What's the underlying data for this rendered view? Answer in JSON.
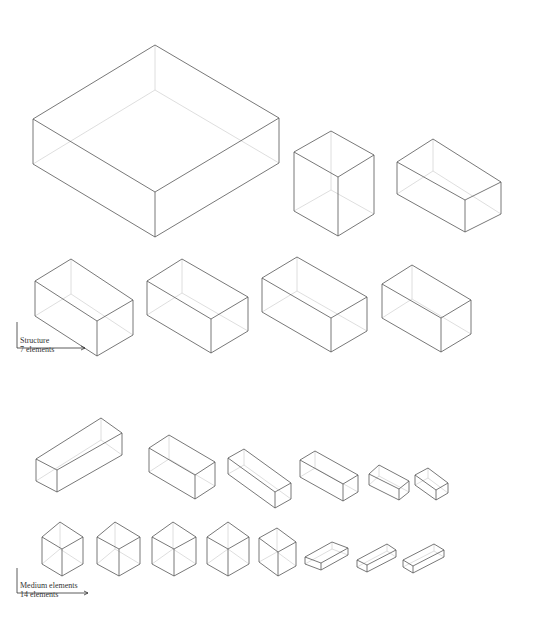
{
  "sections": [
    {
      "id": "structure",
      "title": "Structure",
      "count_label": "7 elements",
      "label_pos": {
        "x": 20,
        "y": 338
      },
      "axis": {
        "x0": 17,
        "y0": 322,
        "y1": 348,
        "x1": 85
      },
      "boxes": [
        {
          "top": [
            155,
            45
          ],
          "left": [
            33,
            119
          ],
          "right": [
            279,
            118
          ],
          "front": [
            155,
            192
          ],
          "h": 45
        },
        {
          "top": [
            331,
            131
          ],
          "left": [
            294,
            152
          ],
          "right": [
            374,
            155
          ],
          "front": [
            338,
            177
          ],
          "h": 59
        },
        {
          "top": [
            433,
            139
          ],
          "left": [
            397,
            162
          ],
          "right": [
            501,
            182
          ],
          "front": [
            465,
            200
          ],
          "h": 32
        },
        {
          "top": [
            71,
            259
          ],
          "left": [
            35,
            281
          ],
          "right": [
            133,
            300
          ],
          "front": [
            97,
            321
          ],
          "h": 35
        },
        {
          "top": [
            182,
            259
          ],
          "left": [
            147,
            281
          ],
          "right": [
            248,
            297
          ],
          "front": [
            211,
            319
          ],
          "h": 34
        },
        {
          "top": [
            297,
            257
          ],
          "left": [
            262,
            278
          ],
          "right": [
            367,
            297
          ],
          "front": [
            331,
            318
          ],
          "h": 34
        },
        {
          "top": [
            412,
            265
          ],
          "left": [
            382,
            284
          ],
          "right": [
            471,
            300
          ],
          "front": [
            441,
            318
          ],
          "h": 34
        }
      ]
    },
    {
      "id": "medium-elements",
      "title": "Medium elements",
      "count_label": "14 elements",
      "label_pos": {
        "x": 22,
        "y": 581
      },
      "axis": {
        "x0": 17,
        "y0": 568,
        "y1": 593,
        "x1": 88
      },
      "boxes": [
        {
          "top": [
            101,
            418
          ],
          "left": [
            36,
            459
          ],
          "right": [
            122,
            433
          ],
          "front": [
            57,
            470
          ],
          "h": 22
        },
        {
          "top": [
            169,
            435
          ],
          "left": [
            149,
            448
          ],
          "right": [
            215,
            462
          ],
          "front": [
            195,
            475
          ],
          "h": 24
        },
        {
          "top": [
            244,
            449
          ],
          "left": [
            228,
            458
          ],
          "right": [
            291,
            483
          ],
          "front": [
            275,
            492
          ],
          "h": 16
        },
        {
          "top": [
            315,
            451
          ],
          "left": [
            300,
            460
          ],
          "right": [
            358,
            475
          ],
          "front": [
            343,
            484
          ],
          "h": 17
        },
        {
          "top": [
            379,
            465
          ],
          "left": [
            369,
            474
          ],
          "right": [
            409,
            481
          ],
          "front": [
            399,
            489
          ],
          "h": 11
        },
        {
          "top": [
            428,
            468
          ],
          "left": [
            415,
            475
          ],
          "right": [
            448,
            483
          ],
          "front": [
            436,
            490
          ],
          "h": 10
        },
        {
          "top": [
            60,
            522
          ],
          "left": [
            42,
            537
          ],
          "right": [
            83,
            537
          ],
          "front": [
            62,
            549
          ],
          "h": 27
        },
        {
          "top": [
            115,
            522
          ],
          "left": [
            97,
            537
          ],
          "right": [
            140,
            537
          ],
          "front": [
            119,
            549
          ],
          "h": 27
        },
        {
          "top": [
            173,
            522
          ],
          "left": [
            152,
            537
          ],
          "right": [
            196,
            537
          ],
          "front": [
            174,
            549
          ],
          "h": 27
        },
        {
          "top": [
            228,
            522
          ],
          "left": [
            207,
            537
          ],
          "right": [
            249,
            537
          ],
          "front": [
            228,
            549
          ],
          "h": 27
        },
        {
          "top": [
            277,
            528
          ],
          "left": [
            259,
            538
          ],
          "right": [
            296,
            542
          ],
          "front": [
            278,
            552
          ],
          "h": 24
        },
        {
          "top": [
            332,
            542
          ],
          "left": [
            305,
            557
          ],
          "right": [
            348,
            548
          ],
          "front": [
            321,
            563
          ],
          "h": 7
        },
        {
          "top": [
            387,
            544
          ],
          "left": [
            357,
            560
          ],
          "right": [
            396,
            550
          ],
          "front": [
            367,
            565
          ],
          "h": 7
        },
        {
          "top": [
            434,
            544
          ],
          "left": [
            403,
            560
          ],
          "right": [
            444,
            550
          ],
          "front": [
            413,
            566
          ],
          "h": 7
        }
      ]
    }
  ]
}
